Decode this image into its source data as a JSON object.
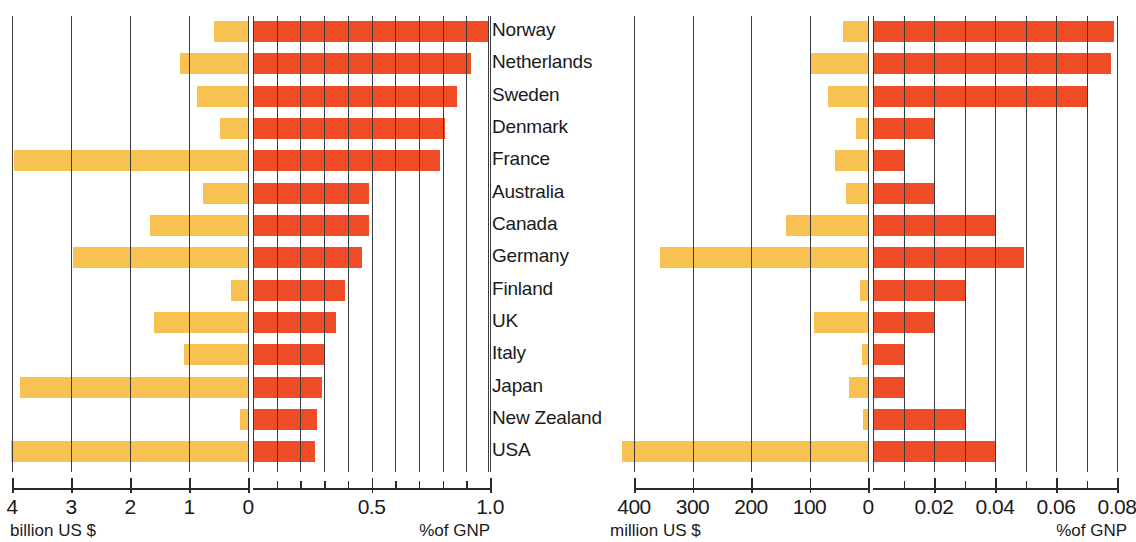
{
  "chart_data": {
    "type": "bar",
    "title": "",
    "orientation": "horizontal-diverging",
    "grid": true,
    "legend_position": "none",
    "categories": [
      "Norway",
      "Netherlands",
      "Sweden",
      "Denmark",
      "France",
      "Australia",
      "Canada",
      "Germany",
      "Finland",
      "UK",
      "Italy",
      "Japan",
      "New Zealand",
      "USA"
    ],
    "panels": [
      {
        "id": "left",
        "left_axis": {
          "label": "billion US $",
          "ticks": [
            4,
            3,
            2,
            1,
            0
          ],
          "min": 0,
          "max": 4,
          "direction": "right-to-left"
        },
        "right_axis": {
          "label": "%of GNP",
          "ticks": [
            0,
            0.1,
            0.2,
            0.3,
            0.4,
            0.5,
            0.6,
            0.7,
            0.8,
            0.9,
            1.0
          ],
          "labeled_ticks": [
            "0",
            "0.5",
            "1.0"
          ],
          "min": 0,
          "max": 1.0
        },
        "series": [
          {
            "name": "billion US $",
            "color": "#f7c24f",
            "side": "left",
            "values": [
              0.57,
              1.15,
              0.86,
              0.47,
              3.97,
              0.76,
              1.66,
              2.96,
              0.28,
              1.6,
              1.08,
              3.86,
              0.13,
              4.02
            ]
          },
          {
            "name": "%of GNP",
            "color": "#f04c27",
            "side": "right",
            "values": [
              0.99,
              0.92,
              0.86,
              0.81,
              0.79,
              0.49,
              0.49,
              0.46,
              0.39,
              0.35,
              0.3,
              0.29,
              0.27,
              0.26
            ]
          }
        ],
        "overflow_rows": [
          {
            "category": "USA",
            "note": "left bar extends beyond 4 billion"
          }
        ]
      },
      {
        "id": "right",
        "left_axis": {
          "label": "million US $",
          "ticks": [
            400,
            300,
            200,
            100,
            0
          ],
          "min": 0,
          "max": 400,
          "direction": "right-to-left"
        },
        "right_axis": {
          "label": "%of GNP",
          "ticks": [
            0,
            0.01,
            0.02,
            0.03,
            0.04,
            0.05,
            0.06,
            0.07,
            0.08
          ],
          "labeled_ticks": [
            "0",
            "0.02",
            "0.04",
            "0.06",
            "0.08"
          ],
          "min": 0,
          "max": 0.08
        },
        "series": [
          {
            "name": "million US $",
            "color": "#f7c24f",
            "side": "left",
            "values": [
              42,
              100,
              68,
              20,
              56,
              38,
              140,
              355,
              14,
              92,
              10,
              32,
              8,
              420
            ]
          },
          {
            "name": "%of GNP",
            "color": "#f04c27",
            "side": "right",
            "values": [
              0.079,
              0.078,
              0.07,
              0.02,
              0.0105,
              0.02,
              0.04,
              0.0495,
              0.03,
              0.02,
              0.01,
              0.01,
              0.03,
              0.04
            ]
          }
        ],
        "overflow_rows": [
          {
            "category": "USA",
            "note": "left bar extends beyond 400 million"
          }
        ]
      }
    ]
  },
  "panels": {
    "left": {
      "left_tick_labels": [
        "4",
        "3",
        "2",
        "1",
        "0"
      ],
      "right_tick_labels": [
        "0.5",
        "1.0"
      ],
      "caption_left": "billion US $",
      "caption_right": "%of GNP"
    },
    "right": {
      "left_tick_labels": [
        "400",
        "300",
        "200",
        "100",
        "0"
      ],
      "right_tick_labels": [
        "0.02",
        "0.04",
        "0.06",
        "0.08"
      ],
      "caption_left": "million US $",
      "caption_right": "%of GNP"
    }
  },
  "colors": {
    "bar_money": "#f7c24f",
    "bar_gnp": "#f04c27",
    "grid": "#3b3b3b",
    "axis": "#2a2a2a",
    "text": "#1a1a1a",
    "background": "#ffffff"
  }
}
